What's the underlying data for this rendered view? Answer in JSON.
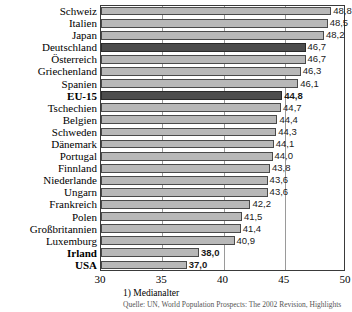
{
  "chart_data": {
    "type": "bar",
    "orientation": "horizontal",
    "title": "",
    "xlabel": "",
    "ylabel": "",
    "xlim": [
      30,
      50
    ],
    "xticks": [
      30,
      35,
      40,
      45,
      50
    ],
    "grid": true,
    "legend": "none",
    "categories": [
      "Schweiz",
      "Italien",
      "Japan",
      "Deutschland",
      "Österreich",
      "Griechenland",
      "Spanien",
      "EU-15",
      "Tschechien",
      "Belgien",
      "Schweden",
      "Dänemark",
      "Portugal",
      "Finnland",
      "Niederlande",
      "Ungarn",
      "Frankreich",
      "Polen",
      "Großbritannien",
      "Luxemburg",
      "Irland",
      "USA"
    ],
    "values": [
      48.8,
      48.5,
      48.2,
      46.7,
      46.7,
      46.3,
      46.1,
      44.8,
      44.7,
      44.4,
      44.3,
      44.1,
      44.0,
      43.8,
      43.6,
      43.6,
      42.2,
      41.5,
      41.4,
      40.9,
      38.0,
      37.0
    ],
    "value_labels": [
      "48,8",
      "48,5",
      "48,2",
      "46,7",
      "46,7",
      "46,3",
      "46,1",
      "44,8",
      "44,7",
      "44,4",
      "44,3",
      "44,1",
      "44,0",
      "43,8",
      "43,6",
      "43,6",
      "42,2",
      "41,5",
      "41,4",
      "40,9",
      "38,0",
      "37,0"
    ],
    "highlighted": [
      "Deutschland",
      "EU-15"
    ],
    "bold_labels": [
      "EU-15",
      "Irland",
      "USA"
    ],
    "colors": {
      "bar": "#b8b8b8",
      "bar_highlight": "#4d4d4d",
      "bar_edge": "#4a4a4a",
      "grid": "#9a9a9a",
      "frame": "#3a3a3a",
      "text": "#000000"
    }
  },
  "footnote": "1) Medianalter",
  "source": "Quelle: UN, World Population Prospects: The 2002 Revision, Highlights"
}
